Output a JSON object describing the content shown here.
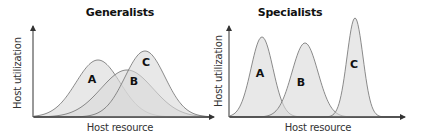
{
  "panels": [
    {
      "title": "Generalists",
      "xlabel": "Host resource",
      "ylabel": "Host utilization",
      "curves": [
        {
          "label": "A",
          "peak_x": 98,
          "peak_y": 60,
          "sigma": 22
        },
        {
          "label": "B",
          "peak_x": 127,
          "peak_y": 70,
          "sigma": 26
        },
        {
          "label": "C",
          "peak_x": 145,
          "peak_y": 51,
          "sigma": 20
        }
      ]
    },
    {
      "title": "Specialists",
      "xlabel": "Host resource",
      "ylabel": "Host utilization",
      "curves": [
        {
          "label": "A",
          "peak_x": 262,
          "peak_y": 37,
          "sigma": 11
        },
        {
          "label": "B",
          "peak_x": 305,
          "peak_y": 43,
          "sigma": 13
        },
        {
          "label": "C",
          "peak_x": 355,
          "peak_y": 18,
          "sigma": 8
        }
      ]
    }
  ],
  "colors": {
    "fill": "#d9d9d9",
    "stroke": "#6e6e6e",
    "axis": "#333333"
  }
}
